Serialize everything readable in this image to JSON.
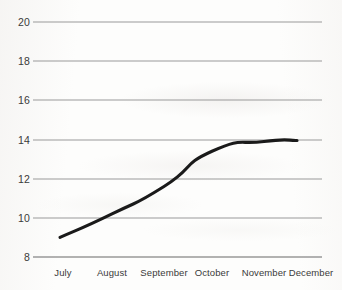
{
  "chart_data": {
    "type": "line",
    "title": "",
    "subtitle": "",
    "xlabel": "",
    "ylabel": "",
    "categories": [
      "July",
      "August",
      "September",
      "October",
      "November",
      "December"
    ],
    "series": [
      {
        "name": "",
        "values": [
          9.0,
          10.2,
          11.6,
          13.4,
          13.9,
          13.95
        ]
      }
    ],
    "yticks": [
      "20",
      "18",
      "16",
      "14",
      "12",
      "10",
      "8"
    ],
    "ytick_values": [
      20,
      18,
      16,
      14,
      12,
      10,
      8
    ],
    "ylim": [
      8,
      20
    ],
    "grid": true,
    "grid_axis": "y",
    "legend": false,
    "legend_position": "none",
    "line_color": "#1a1a1a",
    "grid_color": "#999999",
    "axis_color": "#999999",
    "background_color": "#fdfdfc",
    "text_color": "#3a3a3a",
    "annotations": []
  },
  "axes": {
    "y": {
      "ticks": [
        {
          "label": "20",
          "value": 20
        },
        {
          "label": "18",
          "value": 18
        },
        {
          "label": "16",
          "value": 16
        },
        {
          "label": "14",
          "value": 14
        },
        {
          "label": "12",
          "value": 12
        },
        {
          "label": "10",
          "value": 10
        },
        {
          "label": "8",
          "value": 8
        }
      ]
    },
    "x": {
      "ticks": [
        {
          "label": "July"
        },
        {
          "label": "August"
        },
        {
          "label": "September"
        },
        {
          "label": "October"
        },
        {
          "label": "November"
        },
        {
          "label": "December"
        }
      ]
    }
  }
}
